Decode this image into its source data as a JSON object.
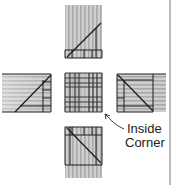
{
  "diagram": {
    "type": "quilt-block-assembly",
    "colors": {
      "background": "#ffffff",
      "fabric_gray": "#b9b9b9",
      "fabric_light": "#d3d3d3",
      "line": "#1e1e1e"
    },
    "pieces": [
      {
        "id": "top",
        "stripes": "vertical"
      },
      {
        "id": "left",
        "stripes": "horizontal"
      },
      {
        "id": "center",
        "pattern": "plaid"
      },
      {
        "id": "right",
        "stripes": "horizontal"
      },
      {
        "id": "bottom",
        "stripes": "vertical"
      }
    ],
    "annotation": {
      "line1": "Inside",
      "line2": "Corner"
    }
  }
}
